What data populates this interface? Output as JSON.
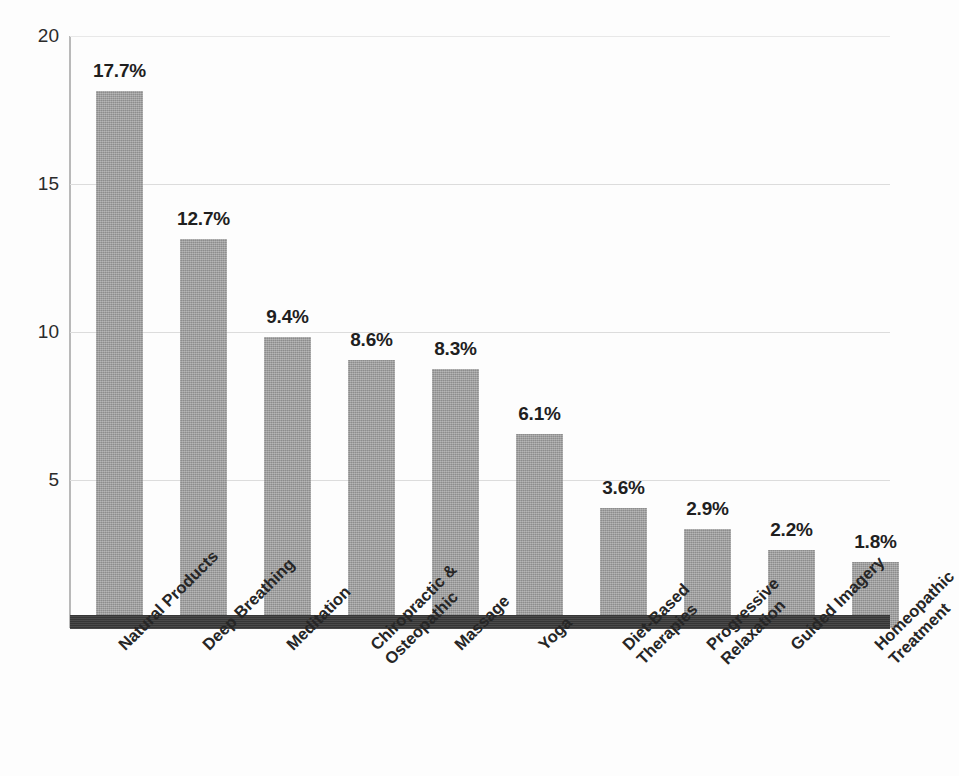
{
  "chart_data": {
    "type": "bar",
    "title": "",
    "subtitle": "",
    "xlabel": "",
    "ylabel": "",
    "ylim": [
      0,
      20
    ],
    "yticks": [
      5,
      10,
      15,
      20
    ],
    "ytick_labels": [
      "5",
      "10",
      "15",
      "20"
    ],
    "grid": true,
    "legend": false,
    "legend_position": "none",
    "value_labels_shown": true,
    "value_label_suffix": "%",
    "categories": [
      "Natural Products",
      "Deep Breathing",
      "Meditation",
      "Chiropractic & Osteopathic",
      "Massage",
      "Yoga",
      "Diet-Based Therapies",
      "Progressive Relaxation",
      "Guided Imagery",
      "Homeopathic Treatment"
    ],
    "category_label_lines": [
      [
        "Natural Products"
      ],
      [
        "Deep Breathing"
      ],
      [
        "Meditation"
      ],
      [
        "Chiropractic &",
        "Osteopathic"
      ],
      [
        "Massage"
      ],
      [
        "Yoga"
      ],
      [
        "Diet-Based",
        "Therapies"
      ],
      [
        "Progressive",
        "Relaxation"
      ],
      [
        "Guided Imagery"
      ],
      [
        "Homeopathic",
        "Treatment"
      ]
    ],
    "values": [
      17.7,
      12.7,
      9.4,
      8.6,
      8.3,
      6.1,
      3.6,
      2.9,
      2.2,
      1.8
    ],
    "value_labels": [
      "17.7%",
      "12.7%",
      "9.4%",
      "8.6%",
      "8.3%",
      "6.1%",
      "3.6%",
      "2.9%",
      "2.2%",
      "1.8%"
    ],
    "colors": {
      "bar_fill": "#9a9a9a",
      "baseline": "#3c3c3c",
      "gridline": "#dcdcdc",
      "axis_line": "#b9b9b9",
      "text": "#1f1f1f",
      "background": "#fdfdfd"
    }
  }
}
